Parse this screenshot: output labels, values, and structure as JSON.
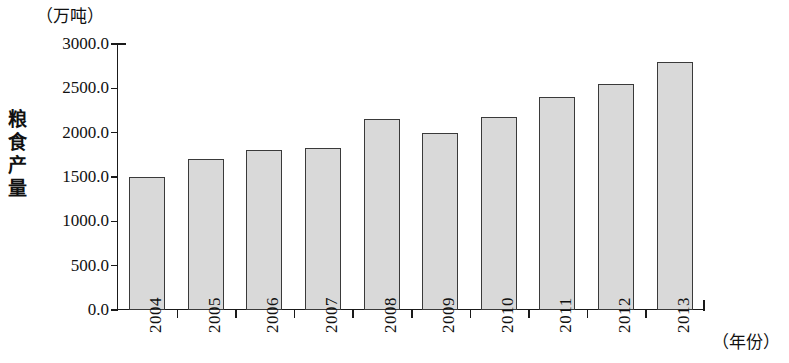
{
  "chart_data": {
    "type": "bar",
    "title": "",
    "subtitle": "",
    "unit_label": "（万吨）",
    "ylabel": "粮食产量",
    "xlabel": "（年份）",
    "categories": [
      "2004",
      "2005",
      "2006",
      "2007",
      "2008",
      "2009",
      "2010",
      "2011",
      "2012",
      "2013"
    ],
    "values": [
      1500,
      1700,
      1810,
      1830,
      2150,
      2000,
      2180,
      2400,
      2550,
      2800
    ],
    "ylim": [
      0,
      3000
    ],
    "ytick_values": [
      3000.0,
      2500.0,
      2000.0,
      1500.0,
      1000.0,
      500.0,
      0.0
    ],
    "ytick_labels": [
      "3000.0",
      "2500.0",
      "2000.0",
      "1500.0",
      "1000.0",
      "500.0",
      "0.0"
    ],
    "grid": false,
    "legend": null,
    "bar_fill_color": "#d9d9d9",
    "bar_border_color": "#3a3a3a",
    "axis_color": "#1a1a1a",
    "background_color": "#ffffff"
  }
}
